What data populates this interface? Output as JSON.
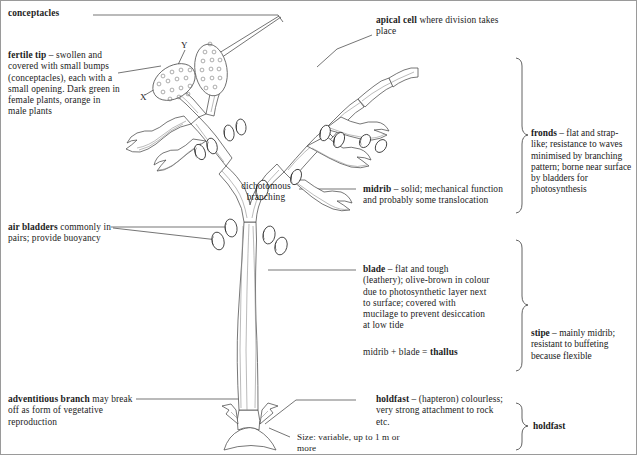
{
  "figure": {
    "type": "labelled-biological-diagram"
  },
  "labels": {
    "conceptacles": "conceptacles",
    "fertile_tip_bold": "fertile tip",
    "fertile_tip_rest": " – swollen and covered with small bumps (conceptacles), each with a small opening. Dark green in female plants, orange in male plants",
    "air_bladders_bold": "air bladders",
    "air_bladders_rest": " commonly in pairs; provide buoyancy",
    "adventitious_bold": "adventitious branch",
    "adventitious_rest": " may break off as form of vegetative reproduction",
    "apical_cell_bold": "apical cell",
    "apical_cell_rest": " where division takes place",
    "midrib_bold": "midrib",
    "midrib_rest": " – solid; mechanical function and probably some translocation",
    "blade_bold": "blade",
    "blade_rest": " – flat and tough (leathery); olive-brown in colour due to photosynthetic layer next to surface; covered with mucilage to prevent desiccation at low tide",
    "thallus_equation_plain": "midrib + blade = ",
    "thallus_equation_bold": "thallus",
    "holdfast_bold": "holdfast",
    "holdfast_rest": " – (hapteron) colourless; very strong attachment to rock etc.",
    "dichotomous": "dichotomous",
    "branching": "branching",
    "size": "Size: variable, up to 1 m or more",
    "x_marker": "X",
    "y_marker": "Y"
  },
  "brackets": [
    {
      "name": "fronds",
      "bold": "fronds",
      "rest": " – flat and strap-like; resistance to waves minimised by branching pattern; borne near surface by bladders for photosynthesis"
    },
    {
      "name": "stipe",
      "bold": "stipe",
      "rest": " – mainly midrib; resistant to buffeting because flexible"
    },
    {
      "name": "holdfast",
      "bold": "holdfast",
      "rest": ""
    }
  ],
  "colors": {
    "ink": "#1a1a1a",
    "line": "#3a3a3a",
    "inner_line": "#8d8d8d",
    "background": "#ffffff",
    "frame": "#9a9a9a"
  }
}
